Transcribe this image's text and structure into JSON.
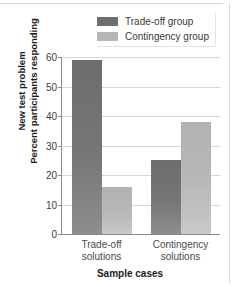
{
  "chart_data": {
    "type": "bar",
    "title": "",
    "xlabel": "Sample cases",
    "ylabel": "New test problem Percent participants responding",
    "ylabel_lines": [
      "New test problem",
      "Percent participants responding"
    ],
    "categories": [
      "Trade-off solutions",
      "Contingency solutions"
    ],
    "category_lines": [
      [
        "Trade-off",
        "solutions"
      ],
      [
        "Contingency",
        "solutions"
      ]
    ],
    "series": [
      {
        "name": "Trade-off group",
        "color": "#6f6f6f",
        "values": [
          59,
          25
        ]
      },
      {
        "name": "Contingency group",
        "color": "#b5b5b5",
        "values": [
          16,
          38
        ]
      }
    ],
    "ylim": [
      0,
      60
    ],
    "yticks": [
      60,
      50,
      40,
      30,
      20,
      10,
      0
    ],
    "ytick_labels": [
      "60",
      "50",
      "40",
      "30",
      "20",
      "10",
      "0"
    ],
    "grid": true,
    "legend_position": "top-right"
  },
  "legend": {
    "items": [
      {
        "label": "Trade-off group"
      },
      {
        "label": "Contingency group"
      }
    ]
  },
  "axes": {
    "y_title_line1": "New test problem",
    "y_title_line2": "Percent participants responding",
    "x_title": "Sample cases"
  }
}
